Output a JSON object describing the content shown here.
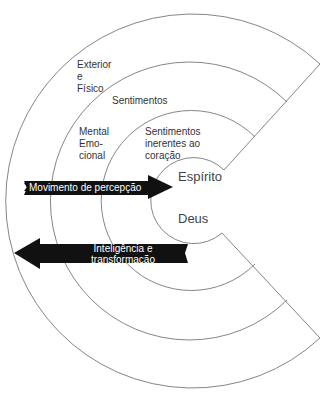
{
  "diagram": {
    "rings": [
      {
        "label_lines": [
          "Exterior",
          "e",
          "Físico"
        ]
      },
      {
        "label_lines": [
          "Sentimentos"
        ]
      },
      {
        "label_lines": [
          "Mental",
          "Emo-",
          "cional"
        ]
      },
      {
        "label_lines": [
          "Sentimentos",
          "inerentes ao",
          "coração"
        ]
      }
    ],
    "center": {
      "top_label": "Espírito",
      "bottom_label": "Deus"
    },
    "arrows": [
      {
        "direction": "right",
        "label": "Movimento de percepção"
      },
      {
        "direction": "left",
        "label_lines": [
          "Inteligência e",
          "transformação"
        ]
      }
    ],
    "colors": {
      "line": "#777777",
      "arrow_fill": "#111111",
      "text": "#333333"
    }
  }
}
